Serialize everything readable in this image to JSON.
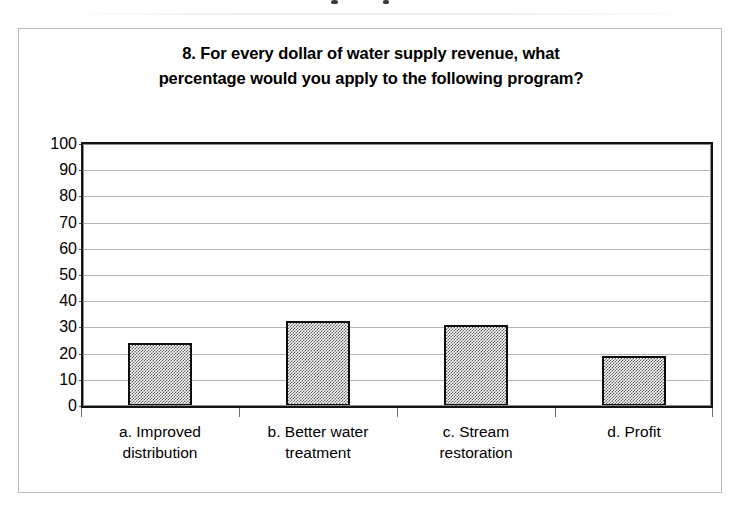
{
  "document": {
    "frame_color": "#b9b9b9",
    "background": "#ffffff"
  },
  "chart_data": {
    "type": "bar",
    "title": "8. For every dollar of water supply revenue, what percentage would you apply to the following program?",
    "title_line_1": "8. For every dollar of water supply revenue, what",
    "title_line_2": "percentage would you apply to the following program?",
    "categories": [
      "a. Improved distribution",
      "b. Better water treatment",
      "c.  Stream restoration",
      "d. Profit"
    ],
    "category_lines": [
      [
        "a. Improved",
        "distribution"
      ],
      [
        "b. Better water",
        "treatment"
      ],
      [
        "c.  Stream",
        "restoration"
      ],
      [
        "d. Profit",
        ""
      ]
    ],
    "values": [
      24,
      32.5,
      31,
      19
    ],
    "xlabel": "",
    "ylabel": "",
    "ylim": [
      0,
      100
    ],
    "ytick_step": 10,
    "yticks": [
      "100",
      "90",
      "80",
      "70",
      "60",
      "50",
      "40",
      "30",
      "20",
      "10",
      "0"
    ],
    "grid": true,
    "grid_axis": "y",
    "legend": false,
    "bar_fill": "#5c5c5c",
    "bar_fill_style": "50% checkerboard dither",
    "bar_border": "#0d0d0d",
    "gridline_color": "#9c9c9c",
    "axis_color": "#131313"
  }
}
